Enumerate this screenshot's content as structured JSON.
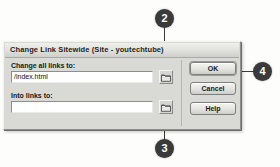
{
  "dialog": {
    "title": "Change Link Sitewide (Site - youtechtube)",
    "fields": [
      {
        "label": "Change all links to:",
        "value": "/index.html",
        "placeholder": "",
        "browse_icon": "folder-icon"
      },
      {
        "label": "Into links to:",
        "value": "",
        "placeholder": "",
        "browse_icon": "folder-icon"
      }
    ],
    "buttons": [
      {
        "label": "OK"
      },
      {
        "label": "Cancel"
      },
      {
        "label": "Help"
      }
    ]
  },
  "callouts": [
    {
      "number": "2"
    },
    {
      "number": "3"
    },
    {
      "number": "4"
    }
  ],
  "colors": {
    "badge_fill": "#3a3a3a",
    "badge_text": "#ffffff",
    "dialog_face": "#d9d9d5",
    "leader_line": "#3b3b3b",
    "input_bg": "#ffffff"
  }
}
